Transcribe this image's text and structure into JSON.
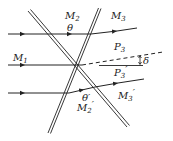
{
  "diagram": {
    "colors": {
      "ink": "#222222",
      "background": "#ffffff"
    },
    "labels": {
      "m2": {
        "main": "M",
        "sub": "2",
        "prime": ""
      },
      "m3": {
        "main": "M",
        "sub": "3",
        "prime": ""
      },
      "m1": {
        "main": "M",
        "sub": "1",
        "prime": ""
      },
      "p3": {
        "main": "P",
        "sub": "3",
        "prime": ""
      },
      "p3p": {
        "main": "P",
        "sub": "3",
        "prime": "′"
      },
      "m3p": {
        "main": "M",
        "sub": "3",
        "prime": "′"
      },
      "m2p": {
        "main": "M",
        "sub": "2",
        "prime": "′"
      },
      "theta": "θ",
      "theta_prime": "θ′",
      "delta": "δ"
    }
  }
}
